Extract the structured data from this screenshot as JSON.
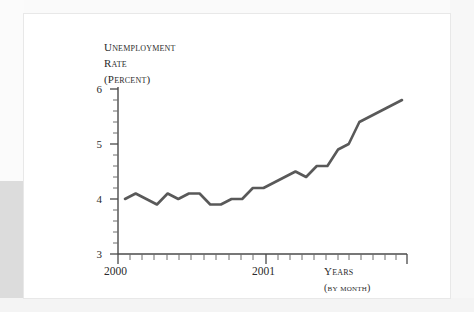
{
  "chart_data": {
    "type": "line",
    "title": "",
    "ylabel": "Unemployment Rate (Percent)",
    "ylabel_lines": [
      "Unemployment",
      "Rate",
      "(Percent)"
    ],
    "xlabel": "Years",
    "xlabel_sub": "(by month)",
    "ylim": [
      3,
      6
    ],
    "yticks": [
      3,
      4,
      5,
      6
    ],
    "ytick_labels": [
      "3",
      "4",
      "5",
      "6"
    ],
    "y_minor_tick_step": 0.2,
    "xticks": [
      2000,
      2001
    ],
    "xtick_labels": [
      "2000",
      "2001"
    ],
    "x_minor_tick_step_months": 1,
    "grid": false,
    "legend": "none",
    "line_color": "#595959",
    "line_width_px": 2.6,
    "categories": [
      "2000-01",
      "2000-02",
      "2000-03",
      "2000-04",
      "2000-05",
      "2000-06",
      "2000-07",
      "2000-08",
      "2000-09",
      "2000-10",
      "2000-11",
      "2000-12",
      "2001-01",
      "2001-02",
      "2001-03",
      "2001-04",
      "2001-05",
      "2001-06",
      "2001-07",
      "2001-08",
      "2001-09",
      "2001-10",
      "2001-11",
      "2001-12",
      "2002-01",
      "2002-02",
      "2002-03"
    ],
    "values": [
      4.0,
      4.1,
      4.0,
      3.9,
      4.1,
      4.0,
      4.1,
      4.1,
      3.9,
      3.9,
      4.0,
      4.0,
      4.2,
      4.2,
      4.3,
      4.4,
      4.5,
      4.4,
      4.6,
      4.6,
      4.9,
      5.0,
      5.4,
      5.5,
      5.6,
      5.7,
      5.8
    ],
    "series": [
      {
        "name": "Unemployment rate",
        "values": [
          4.0,
          4.1,
          4.0,
          3.9,
          4.1,
          4.0,
          4.1,
          4.1,
          3.9,
          3.9,
          4.0,
          4.0,
          4.2,
          4.2,
          4.3,
          4.4,
          4.5,
          4.4,
          4.6,
          4.6,
          4.9,
          5.0,
          5.4,
          5.5,
          5.6,
          5.7,
          5.8
        ]
      }
    ],
    "annotations": []
  },
  "axis": {
    "y_title_1": "Unemployment",
    "y_title_2": "Rate",
    "y_title_3": "(Percent)",
    "x_tick_2000": "2000",
    "x_tick_2001": "2001",
    "x_title": "Years",
    "x_subtitle": "(by month)",
    "y_tick_6": "6",
    "y_tick_5": "5",
    "y_tick_4": "4",
    "y_tick_3": "3"
  },
  "colors": {
    "line": "#595959",
    "axis": "#4a4a4a",
    "text": "#2b2b2b",
    "panel": "#ffffff",
    "page_background": "#f2f2f2"
  }
}
